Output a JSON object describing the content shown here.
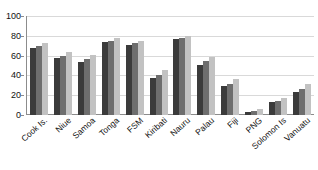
{
  "chart_data": {
    "type": "bar",
    "title": "",
    "subtitle": "",
    "xlabel": "",
    "ylabel": "",
    "ylim": [
      0,
      100
    ],
    "yticks": [
      0,
      20,
      40,
      60,
      80,
      100
    ],
    "grid": true,
    "legend": "none",
    "orientation": "vertical",
    "grouping": "clustered",
    "categories": [
      "Cook Is.",
      "Niue",
      "Samoa",
      "Tonga",
      "FSM",
      "Kiribati",
      "Nauru",
      "Palau",
      "Fiji",
      "PNG",
      "Solomon Is",
      "Vanuatu"
    ],
    "series": [
      {
        "name": "series-1",
        "color": "#3b3b3b",
        "values": [
          68,
          58,
          54,
          74,
          71,
          37,
          77,
          51,
          29,
          3,
          13,
          23
        ]
      },
      {
        "name": "series-2",
        "color": "#6e6e6e",
        "values": [
          70,
          60,
          57,
          75,
          73,
          40,
          78,
          55,
          31,
          4,
          14,
          26
        ]
      },
      {
        "name": "series-3",
        "color": "#c2c2c2",
        "values": [
          73,
          64,
          61,
          78,
          75,
          45,
          80,
          59,
          36,
          6,
          17,
          31
        ]
      }
    ]
  }
}
